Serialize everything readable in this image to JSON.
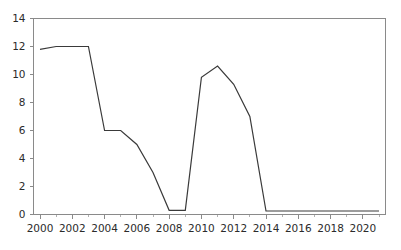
{
  "chart_data": {
    "type": "line",
    "title": "",
    "subtitle": "",
    "xlabel": "",
    "ylabel": "",
    "xlim": [
      2000,
      2021
    ],
    "ylim": [
      0,
      14
    ],
    "grid": false,
    "legend": null,
    "legend_position": "none",
    "series_color": "#3a3a3a",
    "axis_color": "#8a8a8a",
    "x": [
      2000,
      2001,
      2002,
      2003,
      2004,
      2005,
      2006,
      2007,
      2008,
      2009,
      2010,
      2011,
      2012,
      2013,
      2014,
      2015,
      2016,
      2017,
      2018,
      2019,
      2020,
      2021
    ],
    "series": [
      {
        "name": "series-1",
        "values": [
          11.8,
          12.0,
          12.0,
          12.0,
          6.0,
          6.0,
          5.0,
          3.0,
          0.3,
          0.3,
          9.8,
          10.6,
          9.3,
          7.0,
          0.25,
          0.25,
          0.25,
          0.25,
          0.25,
          0.25,
          0.25,
          0.25
        ]
      }
    ],
    "x_ticks": [
      2000,
      2002,
      2004,
      2006,
      2008,
      2010,
      2012,
      2014,
      2016,
      2018,
      2020
    ],
    "x_tick_labels": [
      "2000",
      "2002",
      "2004",
      "2006",
      "2008",
      "2010",
      "2012",
      "2014",
      "2016",
      "2018",
      "2020"
    ],
    "x_minor_step": 1,
    "y_ticks": [
      0,
      2,
      4,
      6,
      8,
      10,
      12,
      14
    ],
    "y_tick_labels": [
      "0",
      "2",
      "4",
      "6",
      "8",
      "10",
      "12",
      "14"
    ]
  }
}
